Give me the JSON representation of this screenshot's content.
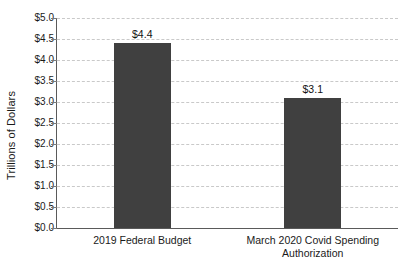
{
  "chart_data": {
    "type": "bar",
    "title": "",
    "xlabel": "",
    "ylabel": "Trillions of Dollars",
    "categories": [
      "2019 Federal Budget",
      "March 2020 Covid Spending Authorization"
    ],
    "category_lines": [
      [
        "2019 Federal Budget"
      ],
      [
        "March 2020 Covid Spending",
        "Authorization"
      ]
    ],
    "values": [
      4.4,
      3.1
    ],
    "value_labels": [
      "$4.4",
      "$3.1"
    ],
    "ylim": [
      0,
      5
    ],
    "ytick_values": [
      5.0,
      4.5,
      4.0,
      3.5,
      3.0,
      2.5,
      2.0,
      1.5,
      1.0,
      0.5,
      0.0
    ],
    "ytick_labels": [
      "$5.0",
      "$4.5",
      "$4.0",
      "$3.5",
      "$3.0",
      "$2.5",
      "$2.0",
      "$1.5",
      "$1.0",
      "$0.5",
      "$0.0"
    ],
    "grid": true,
    "grid_style": "dashed",
    "grid_color": "#c9c9c9",
    "legend": false,
    "bar_color": "#404040",
    "axis_color": "#5a5a5a",
    "background_color": "#ffffff",
    "units": "Trillions of Dollars"
  }
}
